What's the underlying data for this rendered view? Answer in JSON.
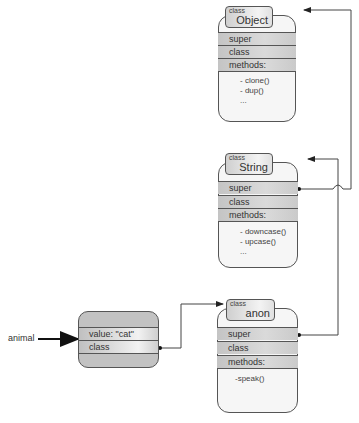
{
  "diagram": {
    "variable": {
      "label": "animal"
    },
    "instance": {
      "rows": [
        "value: \"cat\"",
        "class"
      ]
    },
    "classes": [
      {
        "id": "object",
        "tab_small": "class",
        "name": "Object",
        "rows": [
          "super",
          "class",
          "methods:"
        ],
        "methods": [
          "- clone()",
          "- dup()",
          "..."
        ]
      },
      {
        "id": "string",
        "tab_small": "class",
        "name": "String",
        "rows": [
          "super",
          "class",
          "methods:"
        ],
        "methods": [
          "- downcase()",
          "- upcase()",
          "..."
        ]
      },
      {
        "id": "anon",
        "tab_small": "class",
        "name": "anon",
        "rows": [
          "super",
          "class",
          "methods:"
        ],
        "methods": [
          "-speak()"
        ]
      }
    ],
    "edges": [
      {
        "from": "variable animal",
        "to": "instance"
      },
      {
        "from": "instance.class",
        "to": "anon"
      },
      {
        "from": "anon.super",
        "to": "String"
      },
      {
        "from": "String.super",
        "to": "Object"
      }
    ],
    "colors": {
      "line": "#333333",
      "row_fill": "#cccccc",
      "box_fill": "#f6f6f6",
      "instance_fill": "#c2c2c2"
    }
  }
}
